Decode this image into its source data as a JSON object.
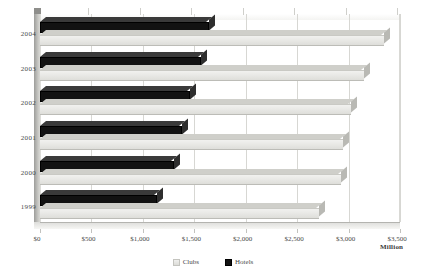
{
  "chart_data": {
    "type": "bar",
    "orientation": "horizontal",
    "title": "",
    "xlabel": "Million",
    "ylabel": "",
    "categories": [
      "2004",
      "2003",
      "2002",
      "2001",
      "2000",
      "1999"
    ],
    "series": [
      {
        "name": "Clubs",
        "color": "#e5e5e1",
        "values": [
          3340,
          3150,
          3020,
          2950,
          2930,
          2710
        ]
      },
      {
        "name": "Hotels",
        "color": "#131313",
        "values": [
          1640,
          1570,
          1460,
          1380,
          1300,
          1140
        ]
      }
    ],
    "xlim": [
      0,
      3500
    ],
    "xticks": [
      0,
      500,
      1000,
      1500,
      2000,
      2500,
      3000,
      3500
    ],
    "xticklabels": [
      "$0",
      "$500",
      "$1,000",
      "$1,500",
      "$2,000",
      "$2,500",
      "$3,000",
      "$3,500"
    ],
    "grid": true,
    "legend_position": "bottom",
    "style": "3d-bar"
  },
  "legend": {
    "items": [
      {
        "label": "Clubs",
        "swatch": "clubs-swatch-icon"
      },
      {
        "label": "Hotels",
        "swatch": "hotels-swatch-icon"
      }
    ]
  },
  "axis": {
    "unit": "Million"
  }
}
